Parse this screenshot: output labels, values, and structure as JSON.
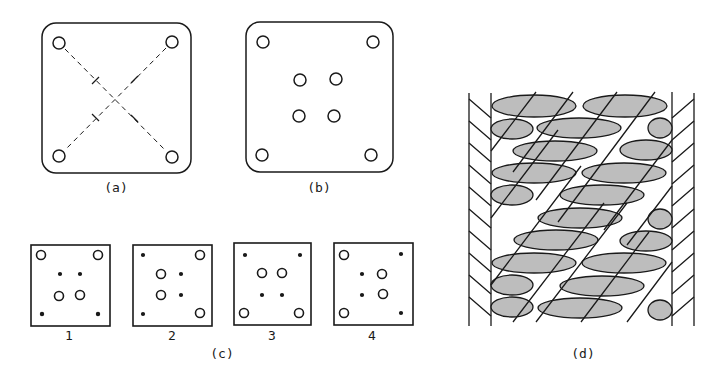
{
  "figure": {
    "panels": [
      {
        "id": "a",
        "label": "(a)",
        "description": "square card with four corner holes and dashed diagonals with tick marks"
      },
      {
        "id": "b",
        "label": "(b)",
        "description": "square card with four corner holes and four center holes"
      },
      {
        "id": "d",
        "label": "(d)",
        "description": "tablet-woven band pattern"
      }
    ],
    "panel_c": {
      "label": "(c)",
      "cards": [
        {
          "number": "1",
          "corners": [
            "hole",
            "hole",
            "dot",
            "dot"
          ],
          "center": [
            "dot",
            "dot",
            "hole",
            "hole"
          ]
        },
        {
          "number": "2",
          "corners": [
            "dot",
            "hole",
            "dot",
            "hole"
          ],
          "center": [
            "hole",
            "dot",
            "hole",
            "dot"
          ]
        },
        {
          "number": "3",
          "corners": [
            "dot",
            "dot",
            "hole",
            "hole"
          ],
          "center": [
            "hole",
            "hole",
            "dot",
            "dot"
          ]
        },
        {
          "number": "4",
          "corners": [
            "hole",
            "dot",
            "hole",
            "dot"
          ],
          "center": [
            "dot",
            "hole",
            "dot",
            "hole"
          ]
        }
      ]
    },
    "colors": {
      "ink": "#1a1a1a",
      "paper": "#ffffff",
      "shade": "#555555"
    }
  }
}
